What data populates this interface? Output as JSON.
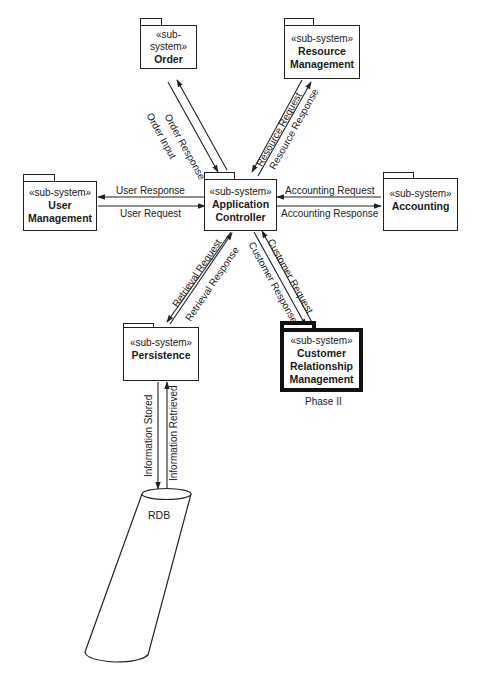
{
  "diagram": {
    "type": "UML subsystem/package diagram",
    "nodes": [
      {
        "id": "order",
        "stereotype": "«sub-system»",
        "name_lines": [
          "Order"
        ]
      },
      {
        "id": "resource",
        "stereotype": "«sub-system»",
        "name_lines": [
          "Resource",
          "Management"
        ]
      },
      {
        "id": "user",
        "stereotype": "«sub-system»",
        "name_lines": [
          "User",
          "Management"
        ]
      },
      {
        "id": "app",
        "stereotype": "«sub-system»",
        "name_lines": [
          "Application",
          "Controller"
        ]
      },
      {
        "id": "accounting",
        "stereotype": "«sub-system»",
        "name_lines": [
          "Accounting"
        ]
      },
      {
        "id": "persistence",
        "stereotype": "«sub-system»",
        "name_lines": [
          "Persistence"
        ]
      },
      {
        "id": "crm",
        "stereotype": "«sub-system»",
        "name_lines": [
          "Customer",
          "Relationship",
          "Management"
        ],
        "caption": "Phase II",
        "emphasized": true
      },
      {
        "id": "rdb",
        "name": "RDB",
        "shape": "cylinder"
      }
    ],
    "edges": [
      {
        "from": "order",
        "to": "app",
        "label": "Order Input"
      },
      {
        "from": "app",
        "to": "order",
        "label": "Order Response"
      },
      {
        "from": "app",
        "to": "resource",
        "label": "Resource Request"
      },
      {
        "from": "resource",
        "to": "app",
        "label": "Resource Response"
      },
      {
        "from": "app",
        "to": "user",
        "label": "User Response"
      },
      {
        "from": "user",
        "to": "app",
        "label": "User Request"
      },
      {
        "from": "accounting",
        "to": "app",
        "label": "Accounting Request"
      },
      {
        "from": "app",
        "to": "accounting",
        "label": "Accounting Response"
      },
      {
        "from": "app",
        "to": "persistence",
        "label": "Retrieval Request"
      },
      {
        "from": "persistence",
        "to": "app",
        "label": "Retrieval Response"
      },
      {
        "from": "crm",
        "to": "app",
        "label": "Customer Request"
      },
      {
        "from": "app",
        "to": "crm",
        "label": "Customer Response"
      },
      {
        "from": "persistence",
        "to": "rdb",
        "label": "Information Stored"
      },
      {
        "from": "rdb",
        "to": "persistence",
        "label": "Information Retrieved"
      }
    ]
  },
  "nodes": {
    "order": {
      "stereotype": "«sub-system»",
      "name1": "Order"
    },
    "resource": {
      "stereotype": "«sub-system»",
      "name1": "Resource",
      "name2": "Management"
    },
    "user": {
      "stereotype": "«sub-system»",
      "name1": "User",
      "name2": "Management"
    },
    "app": {
      "stereotype": "«sub-system»",
      "name1": "Application",
      "name2": "Controller"
    },
    "accounting": {
      "stereotype": "«sub-system»",
      "name1": "Accounting"
    },
    "persistence": {
      "stereotype": "«sub-system»",
      "name1": "Persistence"
    },
    "crm": {
      "stereotype": "«sub-system»",
      "name1": "Customer",
      "name2": "Relationship",
      "name3": "Management",
      "caption": "Phase II"
    },
    "rdb": {
      "name": "RDB"
    }
  },
  "labels": {
    "order_response": "Order Response",
    "order_input": "Order Input",
    "resource_request": "Resource Request",
    "resource_response": "Resource Response",
    "user_response": "User Response",
    "user_request": "User Request",
    "accounting_request": "Accounting Request",
    "accounting_response": "Accounting Response",
    "retrieval_request": "Retrieval Request",
    "retrieval_response": "Retrieval Response",
    "customer_request": "Customer Request",
    "customer_response": "Customer Response",
    "information_stored": "Information Stored",
    "information_retrieved": "Information Retrieved"
  }
}
